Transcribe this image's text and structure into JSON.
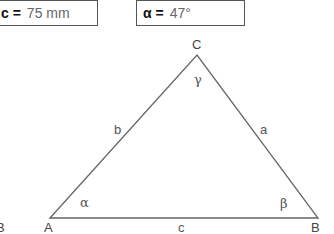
{
  "inputs": {
    "side_c": {
      "label": "c =",
      "value": "75 mm"
    },
    "angle_alpha": {
      "label": "α =",
      "value": "47°"
    }
  },
  "triangle": {
    "vertices": {
      "A": "A",
      "B": "B",
      "C": "C"
    },
    "sides": {
      "a": "a",
      "b": "b",
      "c": "c"
    },
    "angles": {
      "alpha": "α",
      "beta": "β",
      "gamma": "γ"
    }
  },
  "clipped_left_label": "B"
}
